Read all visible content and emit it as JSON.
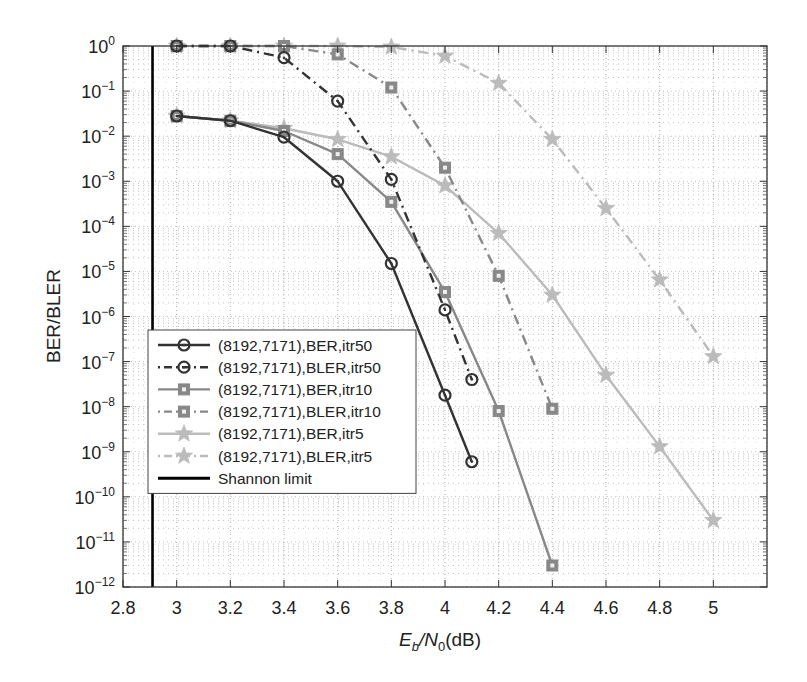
{
  "chart_data": {
    "type": "line",
    "title": "",
    "xlabel": "Eb/N0(dB)",
    "ylabel": "BER/BLER",
    "xscale": "linear",
    "yscale": "log",
    "xlim": [
      2.8,
      5.2
    ],
    "ylim": [
      1e-12,
      1
    ],
    "x_ticks": [
      2.8,
      3,
      3.2,
      3.4,
      3.6,
      3.8,
      4,
      4.2,
      4.4,
      4.6,
      4.8,
      5
    ],
    "x_tick_labels": [
      "2.8",
      "3",
      "3.2",
      "3.4",
      "3.6",
      "3.8",
      "4",
      "4.2",
      "4.4",
      "4.6",
      "4.8",
      "5"
    ],
    "y_tick_exponents": [
      0,
      -1,
      -2,
      -3,
      -4,
      -5,
      -6,
      -7,
      -8,
      -9,
      -10,
      -11,
      -12
    ],
    "grid": true,
    "legend_position": "lower left",
    "series": [
      {
        "name": "(8192,7171),BER,itr50",
        "color": "#333333",
        "linestyle": "solid",
        "marker": "circle",
        "x": [
          3.0,
          3.2,
          3.4,
          3.6,
          3.8,
          4.0,
          4.1
        ],
        "values": [
          0.028,
          0.022,
          0.0095,
          0.001,
          1.5e-05,
          1.8e-08,
          6e-10
        ]
      },
      {
        "name": "(8192,7171),BLER,itr50",
        "color": "#333333",
        "linestyle": "dashdot",
        "marker": "circle",
        "x": [
          3.0,
          3.2,
          3.4,
          3.6,
          3.8,
          4.0,
          4.1
        ],
        "values": [
          1.0,
          1.0,
          0.55,
          0.06,
          0.0011,
          1.4e-06,
          4e-08
        ]
      },
      {
        "name": "(8192,7171),BER,itr10",
        "color": "#888888",
        "linestyle": "solid",
        "marker": "square",
        "x": [
          3.0,
          3.2,
          3.4,
          3.6,
          3.8,
          4.0,
          4.2,
          4.4
        ],
        "values": [
          0.028,
          0.022,
          0.013,
          0.004,
          0.00035,
          3.5e-06,
          8e-09,
          3e-12
        ]
      },
      {
        "name": "(8192,7171),BLER,itr10",
        "color": "#888888",
        "linestyle": "dashdot",
        "marker": "square",
        "x": [
          3.0,
          3.2,
          3.4,
          3.6,
          3.8,
          4.0,
          4.2,
          4.4
        ],
        "values": [
          1.0,
          1.0,
          1.0,
          0.65,
          0.12,
          0.002,
          8e-06,
          9e-09
        ]
      },
      {
        "name": "(8192,7171),BER,itr5",
        "color": "#bbbbbb",
        "linestyle": "solid",
        "marker": "star",
        "x": [
          3.0,
          3.2,
          3.4,
          3.6,
          3.8,
          4.0,
          4.2,
          4.4,
          4.6,
          4.8,
          5.0
        ],
        "values": [
          0.028,
          0.022,
          0.015,
          0.0085,
          0.0035,
          0.0008,
          7e-05,
          3e-06,
          5e-08,
          1.3e-09,
          3e-11
        ]
      },
      {
        "name": "(8192,7171),BLER,itr5",
        "color": "#bbbbbb",
        "linestyle": "dashdot",
        "marker": "star",
        "x": [
          3.0,
          3.2,
          3.4,
          3.6,
          3.8,
          4.0,
          4.2,
          4.4,
          4.6,
          4.8,
          5.0
        ],
        "values": [
          1.0,
          1.0,
          1.0,
          1.0,
          0.95,
          0.6,
          0.15,
          0.0085,
          0.00025,
          6.5e-06,
          1.3e-07
        ]
      },
      {
        "name": "Shannon limit",
        "color": "#000000",
        "linestyle": "solid",
        "marker": "none",
        "type": "vertical_line",
        "x_value": 2.91
      }
    ]
  },
  "axes": {
    "xlabel_main": "E",
    "xlabel_sub1": "b",
    "xlabel_mid": "/N",
    "xlabel_sub2": "0",
    "xlabel_end": "(dB)",
    "ylabel": "BER/BLER"
  },
  "legend": {
    "items": [
      {
        "label": "(8192,7171),BER,itr50"
      },
      {
        "label": "(8192,7171),BLER,itr50"
      },
      {
        "label": "(8192,7171),BER,itr10"
      },
      {
        "label": "(8192,7171),BLER,itr10"
      },
      {
        "label": "(8192,7171),BER,itr5"
      },
      {
        "label": "(8192,7171),BLER,itr5"
      },
      {
        "label": "Shannon limit"
      }
    ]
  }
}
